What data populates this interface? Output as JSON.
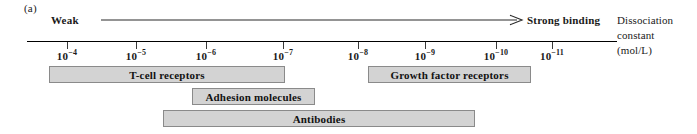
{
  "figure": {
    "panel_label": "(a)",
    "weak_label": "Weak",
    "strong_label": "Strong binding",
    "arrow_icon": "right-arrow-icon"
  },
  "axis_caption": {
    "line1": "Dissociation",
    "line2": "constant",
    "line3": "(mol/L)"
  },
  "chart_data": {
    "type": "bar",
    "xlabel": "Dissociation constant (mol/L)",
    "ylabel": "",
    "orientation": "horizontal",
    "scale": "log10",
    "xlim": [
      -3.6,
      -11.45
    ],
    "grid": false,
    "legend": null,
    "annotations": [
      {
        "text": "Weak",
        "position": "axis-left"
      },
      {
        "text": "Strong binding",
        "position": "axis-right"
      }
    ],
    "axis_ticks": [
      {
        "mantissa": "10",
        "exponent": "−4",
        "value": 0.0001,
        "x": 67
      },
      {
        "mantissa": "10",
        "exponent": "−5",
        "value": 1e-05,
        "x": 136
      },
      {
        "mantissa": "10",
        "exponent": "−6",
        "value": 1e-06,
        "x": 206
      },
      {
        "mantissa": "10",
        "exponent": "−7",
        "value": 1e-07,
        "x": 283
      },
      {
        "mantissa": "10",
        "exponent": "−8",
        "value": 1e-08,
        "x": 358
      },
      {
        "mantissa": "10",
        "exponent": "−9",
        "value": 1e-09,
        "x": 425
      },
      {
        "mantissa": "10",
        "exponent": "−10",
        "value": 1e-10,
        "x": 496
      },
      {
        "mantissa": "10",
        "exponent": "−11",
        "value": 1e-11,
        "x": 552
      }
    ],
    "categories": [
      "T-cell receptors",
      "Growth factor receptors",
      "Adhesion molecules",
      "Antibodies"
    ],
    "bars": [
      {
        "label": "T-cell receptors",
        "range_start": 0.00017,
        "range_end": 6.5e-08,
        "row": 0,
        "x": 49,
        "width": 236,
        "y": 66
      },
      {
        "label": "Growth factor receptors",
        "range_start": 1.2e-08,
        "range_end": 2e-11,
        "row": 0,
        "x": 368,
        "width": 163,
        "y": 66
      },
      {
        "label": "Adhesion molecules",
        "range_start": 4e-06,
        "range_end": 6e-09,
        "row": 1,
        "x": 192,
        "width": 123,
        "y": 88
      },
      {
        "label": "Antibodies",
        "range_start": 2.2e-06,
        "range_end": 1.5e-10,
        "row": 2,
        "x": 163,
        "width": 312,
        "y": 110
      }
    ]
  }
}
